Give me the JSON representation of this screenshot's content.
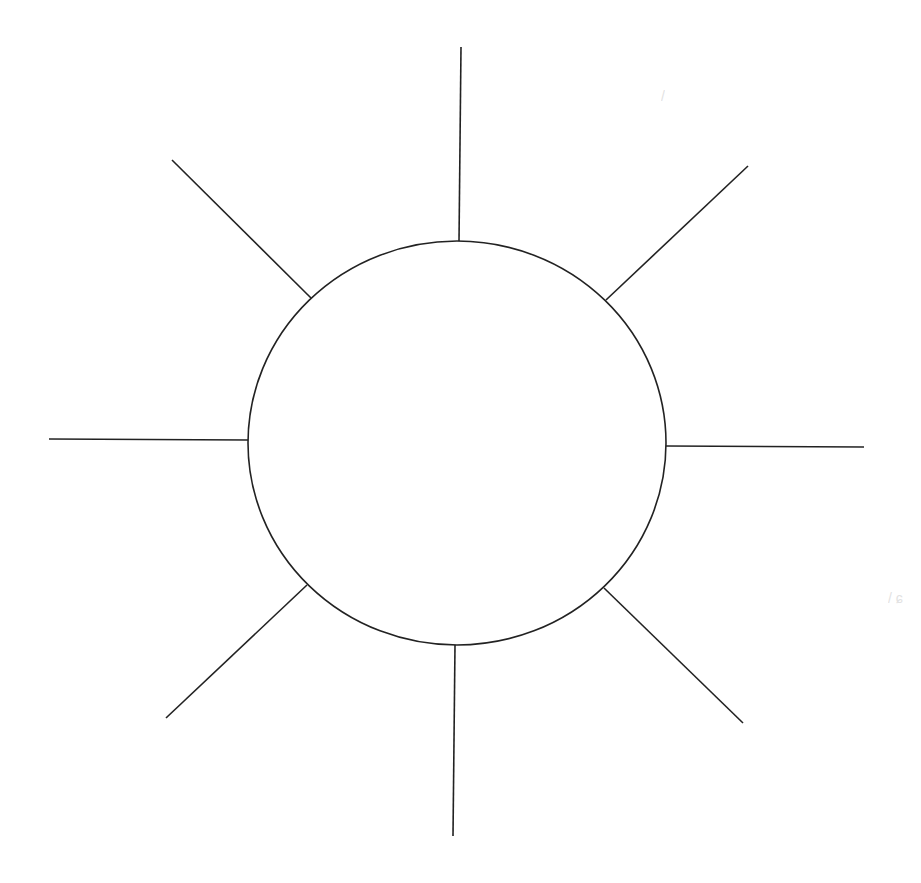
{
  "diagram": {
    "type": "concept-web",
    "header_fragment": "",
    "stroke_color": "#222222",
    "stroke_width": 1.6,
    "background": "#ffffff",
    "center_circle": {
      "cx": 457,
      "cy": 443,
      "rx": 209,
      "ry": 202,
      "label": ""
    },
    "spokes": [
      {
        "name": "spoke-top",
        "x1": 459,
        "y1": 241,
        "x2": 461,
        "y2": 47
      },
      {
        "name": "spoke-top-right",
        "x1": 606,
        "y1": 300,
        "x2": 748,
        "y2": 166
      },
      {
        "name": "spoke-right",
        "x1": 666,
        "y1": 446,
        "x2": 864,
        "y2": 447
      },
      {
        "name": "spoke-bottom-right",
        "x1": 604,
        "y1": 588,
        "x2": 743,
        "y2": 723
      },
      {
        "name": "spoke-bottom",
        "x1": 455,
        "y1": 645,
        "x2": 453,
        "y2": 836
      },
      {
        "name": "spoke-bottom-left",
        "x1": 307,
        "y1": 585,
        "x2": 166,
        "y2": 718
      },
      {
        "name": "spoke-left",
        "x1": 248,
        "y1": 440,
        "x2": 49,
        "y2": 439
      },
      {
        "name": "spoke-top-left",
        "x1": 311,
        "y1": 298,
        "x2": 172,
        "y2": 160
      }
    ],
    "artifacts": [
      {
        "text": "/",
        "x": 661,
        "y": 88
      },
      {
        "text": "/ ɕ",
        "x": 888,
        "y": 590
      }
    ]
  }
}
